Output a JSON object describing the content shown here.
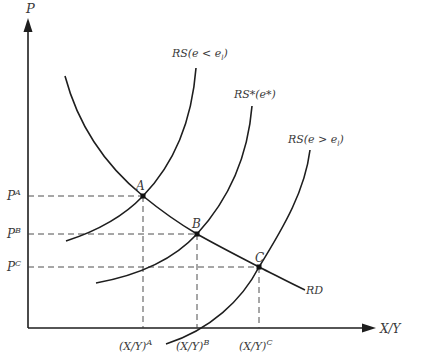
{
  "diagram": {
    "type": "relative supply-demand diagram",
    "y_axis_label": "P",
    "x_axis_label": "X/Y",
    "curves": [
      {
        "id": "rd",
        "label": "RD",
        "kind": "relative demand (downward sloping)"
      },
      {
        "id": "rs_low",
        "label": "RS(e < e",
        "subscript": "l",
        "suffix": ")"
      },
      {
        "id": "rs_star",
        "label": "RS*(e*)"
      },
      {
        "id": "rs_high",
        "label": "RS(e > e",
        "subscript": "l",
        "suffix": ")"
      }
    ],
    "points": [
      {
        "label": "A",
        "price_label": "P",
        "price_sup": "A",
        "qty_label": "(X/Y)",
        "qty_sup": "A"
      },
      {
        "label": "B",
        "price_label": "P",
        "price_sup": "B",
        "qty_label": "(X/Y)",
        "qty_sup": "B"
      },
      {
        "label": "C",
        "price_label": "P",
        "price_sup": "C",
        "qty_label": "(X/Y)",
        "qty_sup": "C"
      }
    ],
    "colors": {
      "line": "#1e1e1e",
      "text": "#3a3a3a",
      "background": "#ffffff"
    }
  }
}
